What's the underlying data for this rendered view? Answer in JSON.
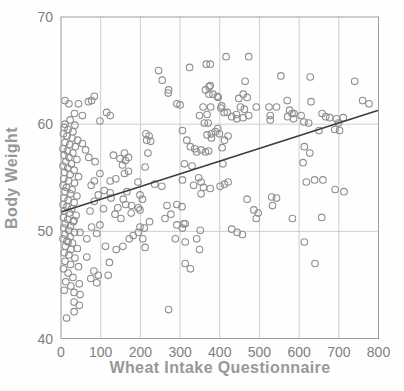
{
  "figure": {
    "background": "#fefefe",
    "colors": {
      "grid": "#c9c9c9",
      "plot_border": "#9c9c9c",
      "marker_stroke": "#8f8f8f",
      "trend_line": "#3d3d3d",
      "tick_text": "#7f7f7f",
      "axis_title_text": "#989898"
    }
  },
  "chart_data": {
    "type": "scatter",
    "title": "",
    "xlabel": "Wheat Intake Questionnaire",
    "ylabel": "Body Weight",
    "xlim": [
      0,
      800
    ],
    "ylim": [
      40,
      70
    ],
    "x_ticks": [
      0,
      100,
      200,
      300,
      400,
      500,
      600,
      700,
      800
    ],
    "y_ticks": [
      40,
      50,
      60,
      70
    ],
    "grid": true,
    "legend_position": "none",
    "marker": "open-circle",
    "trend_line": {
      "x": [
        0,
        800
      ],
      "y": [
        51.8,
        61.3
      ]
    },
    "points": [
      [
        77,
        62.2
      ],
      [
        84,
        62.6
      ],
      [
        69,
        62.1
      ],
      [
        44,
        61.9
      ],
      [
        10,
        62.2
      ],
      [
        20,
        61.9
      ],
      [
        115,
        61.1
      ],
      [
        34,
        61
      ],
      [
        54,
        60.8
      ],
      [
        23,
        60.4
      ],
      [
        10,
        60
      ],
      [
        35,
        59.9
      ],
      [
        124,
        60.8
      ],
      [
        98,
        60.3
      ],
      [
        8,
        59.7
      ],
      [
        18,
        59.5
      ],
      [
        30,
        59.3
      ],
      [
        6,
        59.1
      ],
      [
        15,
        58.9
      ],
      [
        28,
        58.7
      ],
      [
        42,
        58.5
      ],
      [
        10,
        58.3
      ],
      [
        22,
        58.1
      ],
      [
        36,
        57.9
      ],
      [
        5,
        57.7
      ],
      [
        16,
        57.5
      ],
      [
        30,
        57.3
      ],
      [
        8,
        57.1
      ],
      [
        20,
        56.9
      ],
      [
        40,
        56.7
      ],
      [
        12,
        56.5
      ],
      [
        26,
        56.3
      ],
      [
        5,
        56.1
      ],
      [
        17,
        55.9
      ],
      [
        33,
        55.7
      ],
      [
        9,
        55.5
      ],
      [
        23,
        55.3
      ],
      [
        44,
        55.1
      ],
      [
        7,
        54.9
      ],
      [
        19,
        54.7
      ],
      [
        34,
        54.5
      ],
      [
        5,
        54.3
      ],
      [
        14,
        54.1
      ],
      [
        28,
        53.9
      ],
      [
        10,
        53.7
      ],
      [
        24,
        53.5
      ],
      [
        40,
        53.3
      ],
      [
        7,
        53.1
      ],
      [
        18,
        52.9
      ],
      [
        33,
        52.7
      ],
      [
        5,
        52.5
      ],
      [
        15,
        52.3
      ],
      [
        27,
        52.1
      ],
      [
        9,
        51.9
      ],
      [
        21,
        51.7
      ],
      [
        38,
        51.5
      ],
      [
        6,
        51.3
      ],
      [
        17,
        51.1
      ],
      [
        31,
        50.9
      ],
      [
        11,
        50.7
      ],
      [
        24,
        50.5
      ],
      [
        7,
        50.3
      ],
      [
        19,
        50.1
      ],
      [
        34,
        49.9
      ],
      [
        10,
        49.7
      ],
      [
        23,
        49.5
      ],
      [
        5,
        49.3
      ],
      [
        15,
        49.1
      ],
      [
        29,
        48.9
      ],
      [
        11,
        48.6
      ],
      [
        25,
        48.3
      ],
      [
        8,
        48
      ],
      [
        33,
        51
      ],
      [
        48,
        49.9
      ],
      [
        18,
        49
      ],
      [
        41,
        48.4
      ],
      [
        20,
        47.8
      ],
      [
        35,
        47.5
      ],
      [
        10,
        47.2
      ],
      [
        24,
        46.9
      ],
      [
        44,
        46.7
      ],
      [
        6,
        46.5
      ],
      [
        18,
        46.1
      ],
      [
        30,
        45.7
      ],
      [
        46,
        45.1
      ],
      [
        12,
        45.3
      ],
      [
        25,
        44.9
      ],
      [
        33,
        44.3
      ],
      [
        48,
        44.1
      ],
      [
        8,
        44.5
      ],
      [
        33,
        43.4
      ],
      [
        46,
        43.1
      ],
      [
        33,
        42.5
      ],
      [
        14,
        41.9
      ],
      [
        65,
        49.3
      ],
      [
        77,
        50.4
      ],
      [
        90,
        49.8
      ],
      [
        98,
        50.6
      ],
      [
        65,
        47.6
      ],
      [
        83,
        46.3
      ],
      [
        75,
        45.6
      ],
      [
        90,
        45.2
      ],
      [
        94,
        45.9
      ],
      [
        86,
        56.5
      ],
      [
        98,
        55.4
      ],
      [
        84,
        54.7
      ],
      [
        76,
        54.3
      ],
      [
        94,
        53.4
      ],
      [
        84,
        52.8
      ],
      [
        73,
        51.9
      ],
      [
        54,
        58.2
      ],
      [
        62,
        57.6
      ],
      [
        70,
        56.9
      ],
      [
        107,
        52.1
      ],
      [
        136,
        51.6
      ],
      [
        112,
        48.6
      ],
      [
        139,
        48.3
      ],
      [
        156,
        48.6
      ],
      [
        172,
        49.3
      ],
      [
        182,
        49.6
      ],
      [
        195,
        49.9
      ],
      [
        122,
        47.1
      ],
      [
        119,
        45.9
      ],
      [
        132,
        57.1
      ],
      [
        149,
        56.8
      ],
      [
        162,
        56.6
      ],
      [
        160,
        57.3
      ],
      [
        170,
        56.9
      ],
      [
        155,
        56.2
      ],
      [
        170,
        55.6
      ],
      [
        160,
        55.4
      ],
      [
        124,
        54.7
      ],
      [
        138,
        54.9
      ],
      [
        109,
        53.8
      ],
      [
        124,
        53.6
      ],
      [
        157,
        53
      ],
      [
        163,
        52.5
      ],
      [
        143,
        52.2
      ],
      [
        151,
        51.2
      ],
      [
        126,
        53.1
      ],
      [
        166,
        53.7
      ],
      [
        178,
        52.4
      ],
      [
        195,
        52.2
      ],
      [
        177,
        51.7
      ],
      [
        194,
        54.6
      ],
      [
        199,
        50.4
      ],
      [
        210,
        50.3
      ],
      [
        206,
        49.3
      ],
      [
        212,
        48.5
      ],
      [
        223,
        50.9
      ],
      [
        214,
        59.1
      ],
      [
        222,
        58.9
      ],
      [
        216,
        58.5
      ],
      [
        226,
        58.4
      ],
      [
        219,
        57.3
      ],
      [
        212,
        56
      ],
      [
        236,
        54.4
      ],
      [
        254,
        54.2
      ],
      [
        199,
        53.4
      ],
      [
        205,
        53
      ],
      [
        199,
        52
      ],
      [
        255,
        64.1
      ],
      [
        246,
        65
      ],
      [
        270,
        62.9
      ],
      [
        271,
        63.2
      ],
      [
        262,
        51.2
      ],
      [
        277,
        51.6
      ],
      [
        292,
        50.6
      ],
      [
        288,
        49.3
      ],
      [
        267,
        52.4
      ],
      [
        292,
        52.5
      ],
      [
        300,
        61.8
      ],
      [
        292,
        61.9
      ],
      [
        306,
        59.4
      ],
      [
        306,
        50.3
      ],
      [
        309,
        50.7
      ],
      [
        305,
        52.3
      ],
      [
        313,
        49
      ],
      [
        271,
        42.7
      ],
      [
        317,
        58.5
      ],
      [
        326,
        57.9
      ],
      [
        337,
        57.7
      ],
      [
        342,
        57.4
      ],
      [
        353,
        57.6
      ],
      [
        364,
        57.4
      ],
      [
        372,
        57.5
      ],
      [
        311,
        56.3
      ],
      [
        330,
        56.1
      ],
      [
        306,
        54.8
      ],
      [
        334,
        54.3
      ],
      [
        347,
        55
      ],
      [
        353,
        54.6
      ],
      [
        359,
        54.1
      ],
      [
        353,
        53.5
      ],
      [
        376,
        54
      ],
      [
        326,
        46.5
      ],
      [
        342,
        49.3
      ],
      [
        349,
        48.3
      ],
      [
        351,
        50.1
      ],
      [
        313,
        50.7
      ],
      [
        313,
        47
      ],
      [
        324,
        65.3
      ],
      [
        366,
        65.6
      ],
      [
        376,
        65.6
      ],
      [
        376,
        63.6
      ],
      [
        373,
        62.8
      ],
      [
        383,
        62.8
      ],
      [
        394,
        62.6
      ],
      [
        358,
        61.6
      ],
      [
        368,
        60.9
      ],
      [
        349,
        60.8
      ],
      [
        361,
        60.1
      ],
      [
        371,
        60.1
      ],
      [
        368,
        59
      ],
      [
        379,
        59.1
      ],
      [
        379,
        58.7
      ],
      [
        389,
        59.3
      ],
      [
        395,
        59.6
      ],
      [
        399,
        59.1
      ],
      [
        412,
        58.5
      ],
      [
        421,
        58.9
      ],
      [
        406,
        57.8
      ],
      [
        416,
        66.3
      ],
      [
        373,
        63.5
      ],
      [
        364,
        63.2
      ],
      [
        396,
        62.5
      ],
      [
        405,
        61.7
      ],
      [
        377,
        61.6
      ],
      [
        403,
        61.5
      ],
      [
        411,
        61.1
      ],
      [
        419,
        61.1
      ],
      [
        443,
        60.5
      ],
      [
        464,
        64
      ],
      [
        459,
        62.8
      ],
      [
        469,
        62.5
      ],
      [
        452,
        61.6
      ],
      [
        462,
        61.4
      ],
      [
        473,
        60.8
      ],
      [
        459,
        60.6
      ],
      [
        492,
        61.6
      ],
      [
        448,
        62.4
      ],
      [
        442,
        60.9
      ],
      [
        430,
        60.7
      ],
      [
        473,
        66.3
      ],
      [
        401,
        54.2
      ],
      [
        412,
        54.4
      ],
      [
        421,
        54.6
      ],
      [
        408,
        56.3
      ],
      [
        430,
        50.2
      ],
      [
        444,
        49.9
      ],
      [
        457,
        49.7
      ],
      [
        469,
        53
      ],
      [
        486,
        52
      ],
      [
        497,
        51.7
      ],
      [
        492,
        51.2
      ],
      [
        527,
        60.8
      ],
      [
        527,
        60.4
      ],
      [
        543,
        61.6
      ],
      [
        524,
        61.6
      ],
      [
        554,
        64.5
      ],
      [
        571,
        60.7
      ],
      [
        582,
        61
      ],
      [
        586,
        60.5
      ],
      [
        570,
        62.2
      ],
      [
        576,
        61.3
      ],
      [
        587,
        61
      ],
      [
        531,
        53.2
      ],
      [
        543,
        53.1
      ],
      [
        533,
        52.4
      ],
      [
        583,
        51.2
      ],
      [
        628,
        64.4
      ],
      [
        630,
        62.1
      ],
      [
        605,
        60.8
      ],
      [
        612,
        60.2
      ],
      [
        624,
        60.1
      ],
      [
        658,
        61
      ],
      [
        667,
        60.7
      ],
      [
        677,
        60.6
      ],
      [
        694,
        60.5
      ],
      [
        650,
        59.4
      ],
      [
        690,
        59.5
      ],
      [
        613,
        57.9
      ],
      [
        627,
        57.3
      ],
      [
        610,
        56.4
      ],
      [
        618,
        54.6
      ],
      [
        639,
        54.8
      ],
      [
        660,
        54.8
      ],
      [
        691,
        53.9
      ],
      [
        657,
        51.3
      ],
      [
        613,
        49
      ],
      [
        640,
        47
      ],
      [
        740,
        64
      ],
      [
        702,
        59.4
      ],
      [
        699,
        60.1
      ],
      [
        711,
        60.6
      ],
      [
        776,
        61.9
      ],
      [
        760,
        62.2
      ],
      [
        713,
        53.7
      ]
    ]
  }
}
